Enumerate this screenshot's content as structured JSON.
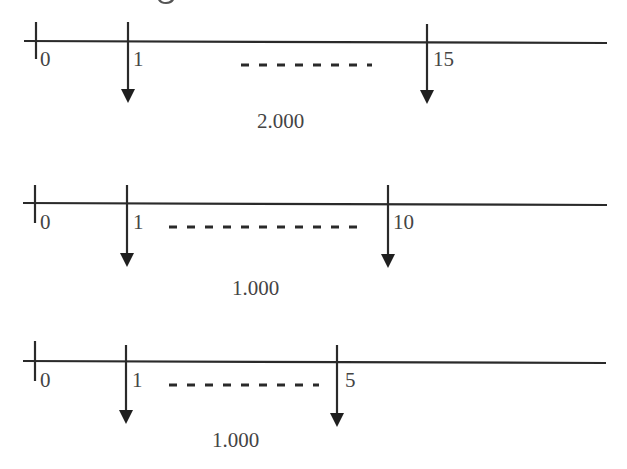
{
  "header_fragment": {
    "note": "descender of cut-off heading text at top edge"
  },
  "colors": {
    "line": "#2a2a2a",
    "text": "#444444",
    "background": "#ffffff"
  },
  "timelines": [
    {
      "id": "timeline-1",
      "axis": {
        "x1": 24,
        "y1": 41,
        "x2": 607,
        "y2": 43
      },
      "origin_tick": {
        "x": 36,
        "top": 22,
        "bottom": 59,
        "label": "0"
      },
      "first_payment": {
        "x": 128,
        "top": 22,
        "tip": 103,
        "label": "1"
      },
      "last_payment": {
        "x": 427,
        "top": 24,
        "tip": 104,
        "label": "15"
      },
      "dashes": {
        "x1": 241,
        "x2": 372,
        "y": 65,
        "count": 7
      },
      "amount": {
        "label": "2.000",
        "x": 257,
        "y": 128
      }
    },
    {
      "id": "timeline-2",
      "axis": {
        "x1": 23,
        "y1": 203,
        "x2": 607,
        "y2": 205
      },
      "origin_tick": {
        "x": 35,
        "top": 185,
        "bottom": 223,
        "label": "0"
      },
      "first_payment": {
        "x": 127,
        "top": 185,
        "tip": 267,
        "label": "1"
      },
      "last_payment": {
        "x": 388,
        "top": 185,
        "tip": 268,
        "label": "10"
      },
      "dashes": {
        "x1": 169,
        "x2": 360,
        "y": 227,
        "count": 10
      },
      "amount": {
        "label": "1.000",
        "x": 232,
        "y": 295
      }
    },
    {
      "id": "timeline-3",
      "axis": {
        "x1": 23,
        "y1": 361,
        "x2": 606,
        "y2": 363
      },
      "origin_tick": {
        "x": 35,
        "top": 341,
        "bottom": 381,
        "label": "0"
      },
      "first_payment": {
        "x": 126,
        "top": 345,
        "tip": 424,
        "label": "1"
      },
      "last_payment": {
        "x": 337,
        "top": 345,
        "tip": 427,
        "label": "5"
      },
      "dashes": {
        "x1": 169,
        "x2": 319,
        "y": 385,
        "count": 8
      },
      "amount": {
        "label": "1.000",
        "x": 212,
        "y": 447
      }
    }
  ]
}
